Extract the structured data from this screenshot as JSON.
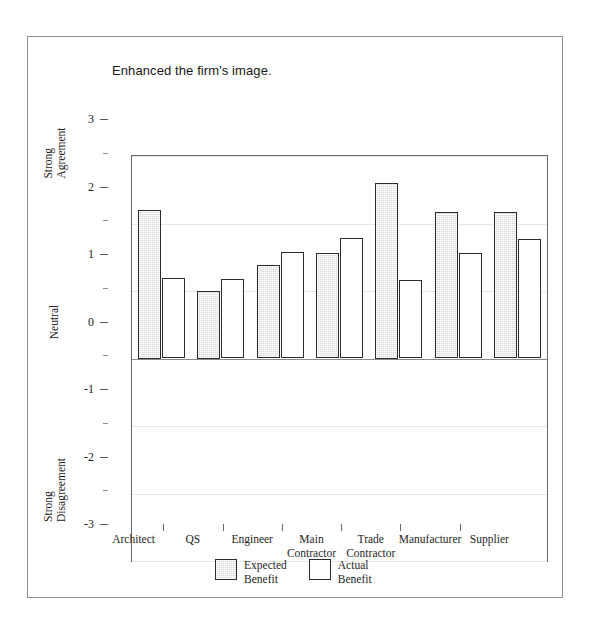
{
  "figure": {
    "title": "Enhanced the firm's image."
  },
  "chart_data": {
    "type": "bar",
    "title": "Enhanced the firm's image.",
    "xlabel": "",
    "ylabel": "",
    "ylim": [
      -3,
      3
    ],
    "ytick_values": [
      3,
      2,
      1,
      0,
      -1,
      -2,
      -3
    ],
    "ytick_labels": [
      "3",
      "2",
      "1",
      "0",
      "-1",
      "-2",
      "-3"
    ],
    "y_minor_step": 0.5,
    "grid": false,
    "legend_position": "bottom",
    "y_anchor_labels": [
      {
        "text": "Strong\nAgreement",
        "value": 2.5
      },
      {
        "text": "Neutral",
        "value": 0
      },
      {
        "text": "Strong\nDisagreement",
        "value": -2.5
      }
    ],
    "categories": [
      "Architect",
      "QS",
      "Engineer",
      "Main\nContractor",
      "Trade\nContractor",
      "Manufacturer",
      "Supplier"
    ],
    "series": [
      {
        "name": "Expected\nBenefit",
        "key": "expected",
        "values": [
          2.2,
          1.0,
          1.38,
          1.57,
          2.6,
          2.17,
          2.17
        ]
      },
      {
        "name": "Actual\nBenefit",
        "key": "actual",
        "values": [
          1.19,
          1.18,
          1.58,
          1.78,
          1.17,
          1.56,
          1.77
        ]
      }
    ]
  },
  "legend": [
    {
      "label": "Expected\nBenefit",
      "style": "expected"
    },
    {
      "label": "Actual\nBenefit",
      "style": "actual"
    }
  ]
}
